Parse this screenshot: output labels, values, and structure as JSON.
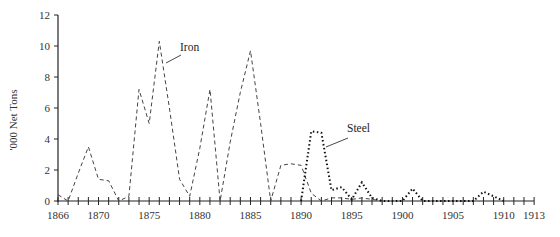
{
  "chart_data": {
    "type": "line",
    "title": "",
    "xlabel": "",
    "ylabel": "'000 Net Tons",
    "xlim": [
      1866,
      1913
    ],
    "ylim": [
      0,
      12
    ],
    "grid": false,
    "legend": "inline labels",
    "x_ticks": [
      1866,
      1870,
      1875,
      1880,
      1885,
      1890,
      1895,
      1900,
      1905,
      1910,
      1913
    ],
    "y_ticks": [
      0,
      2,
      4,
      6,
      8,
      10,
      12
    ],
    "series": [
      {
        "name": "Iron",
        "style": "dashed",
        "color": "#444444",
        "label_pos": {
          "x": 180,
          "y": 51
        },
        "leader": [
          166,
          63,
          181,
          55
        ],
        "points": [
          [
            1866,
            0.4
          ],
          [
            1867,
            0.0
          ],
          [
            1868,
            1.8
          ],
          [
            1869,
            3.5
          ],
          [
            1870,
            1.4
          ],
          [
            1871,
            1.3
          ],
          [
            1872,
            0.0
          ],
          [
            1873,
            0.3
          ],
          [
            1874,
            7.2
          ],
          [
            1875,
            5.0
          ],
          [
            1876,
            10.3
          ],
          [
            1877,
            6.0
          ],
          [
            1878,
            1.4
          ],
          [
            1879,
            0.3
          ],
          [
            1880,
            3.4
          ],
          [
            1881,
            7.2
          ],
          [
            1882,
            0.0
          ],
          [
            1883,
            3.8
          ],
          [
            1884,
            7.0
          ],
          [
            1885,
            9.7
          ],
          [
            1886,
            5.0
          ],
          [
            1887,
            0.0
          ],
          [
            1888,
            2.3
          ],
          [
            1889,
            2.4
          ],
          [
            1890,
            2.3
          ],
          [
            1891,
            0.5
          ],
          [
            1892,
            0.0
          ],
          [
            1893,
            0.2
          ],
          [
            1894,
            0.2
          ],
          [
            1895,
            0.1
          ],
          [
            1896,
            0.2
          ],
          [
            1897,
            0.1
          ],
          [
            1898,
            0.0
          ]
        ]
      },
      {
        "name": "Steel",
        "style": "dotted",
        "color": "#111111",
        "label_pos": {
          "x": 347,
          "y": 132
        },
        "leader": [
          326,
          147,
          348,
          138
        ],
        "points": [
          [
            1890,
            0.0
          ],
          [
            1891,
            4.5
          ],
          [
            1892,
            4.4
          ],
          [
            1893,
            0.7
          ],
          [
            1894,
            0.9
          ],
          [
            1895,
            0.1
          ],
          [
            1896,
            1.2
          ],
          [
            1897,
            0.2
          ],
          [
            1898,
            0.0
          ],
          [
            1899,
            0.0
          ],
          [
            1900,
            0.0
          ],
          [
            1901,
            0.8
          ],
          [
            1902,
            0.0
          ],
          [
            1903,
            0.0
          ],
          [
            1904,
            0.0
          ],
          [
            1905,
            0.0
          ],
          [
            1906,
            0.0
          ],
          [
            1907,
            0.0
          ],
          [
            1908,
            0.6
          ],
          [
            1909,
            0.3
          ],
          [
            1910,
            0.0
          ]
        ]
      }
    ]
  },
  "layout": {
    "x0_px": 58,
    "x_per_year": 10.13,
    "y0_px": 201,
    "y_per_unit": 15.5
  }
}
